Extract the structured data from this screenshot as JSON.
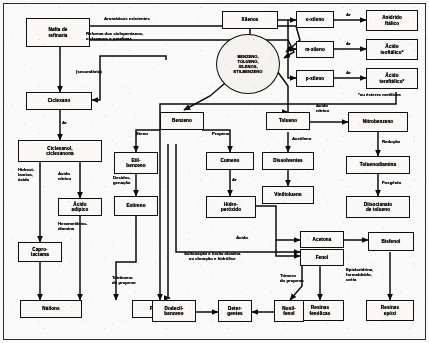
{
  "diagram": {
    "type": "process-flowchart",
    "language": "pt-BR",
    "colors": {
      "paper": "#f3f2f0",
      "ink": "#201e1c",
      "node_fill": "#efeeec"
    },
    "hub": {
      "id": "btx",
      "label": "BENZENO,\nTOLUENO,\nXILENOS,\nETILBENZENO",
      "shape": "circle"
    },
    "nodes": [
      {
        "id": "nafta",
        "label": "Nafta de\nrefinaria"
      },
      {
        "id": "ciclexano",
        "label": "Ciclexano"
      },
      {
        "id": "ciclexanol",
        "label": "Ciclexanol,\nciclexanona"
      },
      {
        "id": "acido_adipico",
        "label": "Ácido\nadípico"
      },
      {
        "id": "caprolactama",
        "label": "Capro-\nlactama"
      },
      {
        "id": "nailons",
        "label": "Náilons"
      },
      {
        "id": "xilenos",
        "label": "Xilenos"
      },
      {
        "id": "o_xileno",
        "label": "o-xileno"
      },
      {
        "id": "m_xileno",
        "label": "m-xileno"
      },
      {
        "id": "p_xileno",
        "label": "p-xileno"
      },
      {
        "id": "anidrido_ftalico",
        "label": "Anidrido\nftálico"
      },
      {
        "id": "acido_isoftalico",
        "label": "Ácido\nisoftálico*"
      },
      {
        "id": "acido_tereftalico",
        "label": "Ácido\ntereftálico*"
      },
      {
        "id": "poliester",
        "label": "Poliéster"
      },
      {
        "id": "tolueno",
        "label": "Tolueno"
      },
      {
        "id": "dissolventes",
        "label": "Dissolventes"
      },
      {
        "id": "viniltolueno",
        "label": "Viniltolueno"
      },
      {
        "id": "nitrobenzeno",
        "label": "Nitrobenzeno"
      },
      {
        "id": "toluenodiamina",
        "label": "Toluenodiamina"
      },
      {
        "id": "diisocianato",
        "label": "Diisocianato\nde tolueno"
      },
      {
        "id": "benzeno",
        "label": "Benzeno"
      },
      {
        "id": "etilbenzeno",
        "label": "Etil-\nbenzeno"
      },
      {
        "id": "estireno",
        "label": "Estireno"
      },
      {
        "id": "cumeno",
        "label": "Cumeno"
      },
      {
        "id": "hidroperoxido",
        "label": "Hidro-\nperóxido"
      },
      {
        "id": "acetona",
        "label": "Acetona"
      },
      {
        "id": "fenol",
        "label": "Fenol"
      },
      {
        "id": "bisfenol",
        "label": "Bisfenol"
      },
      {
        "id": "resinas_epoxi",
        "label": "Resinas\nepóxi"
      },
      {
        "id": "resinas_fenolicas",
        "label": "Resinas\nfenólicas"
      },
      {
        "id": "dodecilbenzeno",
        "label": "Dodecil-\nbenzeno"
      },
      {
        "id": "detergentes",
        "label": "Deter-\ngentes"
      },
      {
        "id": "nonilfenol",
        "label": "Nonil-\nfenol"
      }
    ],
    "edge_labels": [
      {
        "id": "aromaticos_existentes",
        "text": "Aromáticos existentes"
      },
      {
        "id": "reforma",
        "text": "Reforma dos ciclopentanos,\nciclexanos e parafinas"
      },
      {
        "id": "secundario",
        "text": "(secundário)"
      },
      {
        "id": "ar1",
        "text": "Ar"
      },
      {
        "id": "hidroxilamina",
        "text": "Hidroxi-\nlamina,\nácido"
      },
      {
        "id": "acido_nitrico_left",
        "text": "Ácido\nnítrico"
      },
      {
        "id": "hexametilenodiamina",
        "text": "Hexametileno-\ndiamina"
      },
      {
        "id": "ar_xilenos_o",
        "text": "Ar"
      },
      {
        "id": "ar_xilenos_m",
        "text": "Ar"
      },
      {
        "id": "ar_xilenos_p",
        "text": "Ar"
      },
      {
        "id": "esteres_metilicos",
        "text": "*ou ésteres metílicos"
      },
      {
        "id": "acido_nitrico_tol",
        "text": "Ácido\nnítrico"
      },
      {
        "id": "reducao",
        "text": "Redução"
      },
      {
        "id": "fosgenio",
        "text": "Fosgênio"
      },
      {
        "id": "acetileno",
        "text": "Acetileno"
      },
      {
        "id": "eteno",
        "text": "Eteno"
      },
      {
        "id": "propeno",
        "text": "Propeno"
      },
      {
        "id": "desidrogenacao",
        "text": "Desidro-\ngenação"
      },
      {
        "id": "ar_cumeno",
        "text": "Ar"
      },
      {
        "id": "acido_hidroperox",
        "text": "Ácido"
      },
      {
        "id": "sulfonacao",
        "text": "Sulfonação e fusão alcalina\nou cloração e hidrólise"
      },
      {
        "id": "trimero_propeno",
        "text": "Trímero\ndo propeno"
      },
      {
        "id": "tetramero_propeno",
        "text": "Tetrâmero\ndo propeno"
      },
      {
        "id": "epicloridrina",
        "text": "Epicloridrina,\nformaldeído,\nuréia"
      }
    ]
  }
}
